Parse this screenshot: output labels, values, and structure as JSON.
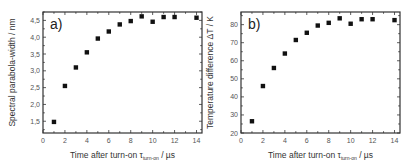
{
  "chart_data": [
    {
      "type": "scatter",
      "panel_label": "a)",
      "title": "",
      "xlabel": "Time after turn-on τ",
      "xlabel_sub": "turn-on",
      "xlabel_unit": " / µs",
      "ylabel": "Spectral parabola-width / nm",
      "xlim": [
        0,
        14.5
      ],
      "ylim": [
        1.15,
        4.75
      ],
      "xticks": [
        0,
        2,
        4,
        6,
        8,
        10,
        12,
        14
      ],
      "xtick_labels": [
        "0",
        "2",
        "4",
        "6",
        "8",
        "10",
        "12",
        "14"
      ],
      "yticks": [
        1.5,
        2.0,
        2.5,
        3.0,
        3.5,
        4.0,
        4.5
      ],
      "ytick_labels": [
        "1,5",
        "2,0",
        "2,5",
        "3,0",
        "3,5",
        "4,0",
        "4,5"
      ],
      "grid": false,
      "legend": null,
      "marker": "square",
      "marker_color": "#111111",
      "x": [
        1,
        2,
        3,
        4,
        5,
        6,
        7,
        8,
        9,
        10,
        11,
        12,
        14
      ],
      "y": [
        1.48,
        2.55,
        3.1,
        3.55,
        3.96,
        4.17,
        4.38,
        4.48,
        4.62,
        4.46,
        4.6,
        4.6,
        4.58
      ]
    },
    {
      "type": "scatter",
      "panel_label": "b)",
      "title": "",
      "xlabel": "Time after turn-on τ",
      "xlabel_sub": "turn-on",
      "xlabel_unit": " / µs",
      "ylabel": "Temperature difference ΔT / K",
      "xlim": [
        0,
        14.5
      ],
      "ylim": [
        20,
        87
      ],
      "xticks": [
        0,
        2,
        4,
        6,
        8,
        10,
        12,
        14
      ],
      "xtick_labels": [
        "0",
        "2",
        "4",
        "6",
        "8",
        "10",
        "12",
        "14"
      ],
      "yticks": [
        20,
        30,
        40,
        50,
        60,
        70,
        80
      ],
      "ytick_labels": [
        "20",
        "30",
        "40",
        "50",
        "60",
        "70",
        "80"
      ],
      "grid": false,
      "legend": null,
      "marker": "square",
      "marker_color": "#111111",
      "x": [
        1,
        2,
        3,
        4,
        5,
        6,
        7,
        8,
        9,
        10,
        11,
        12,
        14
      ],
      "y": [
        26.5,
        46,
        56,
        64,
        71.5,
        75.5,
        79.5,
        81,
        83.5,
        80.5,
        83,
        83,
        82.5
      ]
    }
  ]
}
